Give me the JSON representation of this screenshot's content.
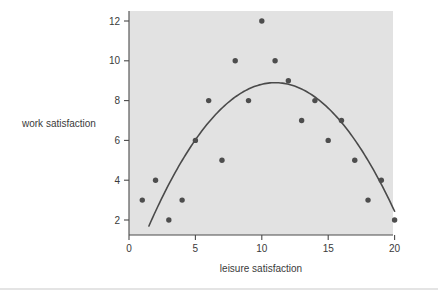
{
  "chart_data": {
    "type": "scatter",
    "title": "",
    "xlabel": "leisure satisfaction",
    "ylabel": "work satisfaction",
    "xlim": [
      0,
      20.8
    ],
    "ylim": [
      1.2,
      12.6
    ],
    "xticks": [
      0,
      5,
      10,
      15,
      20
    ],
    "xtick_labels": [
      "0",
      "5",
      "10",
      "15",
      "20"
    ],
    "yticks": [
      2,
      4,
      6,
      8,
      10,
      12
    ],
    "ytick_labels": [
      "2",
      "4",
      "6",
      "8",
      "10",
      "12"
    ],
    "grid": false,
    "legend": null,
    "point_color": "#4d4d4d",
    "curve_color": "#4a4a4a",
    "plot_background": "#e2e2e2",
    "figure_background": "#ffffff",
    "x": [
      1,
      2,
      3,
      4,
      5,
      6,
      7,
      8,
      9,
      10,
      11,
      12,
      13,
      14,
      15,
      16,
      17,
      18,
      19,
      20
    ],
    "y": [
      3,
      4,
      2,
      3,
      6,
      8,
      5,
      10,
      8,
      12,
      10,
      9,
      7,
      8,
      6,
      7,
      5,
      3,
      4,
      2
    ],
    "points": [
      {
        "x": 1,
        "y": 3
      },
      {
        "x": 2,
        "y": 4
      },
      {
        "x": 3,
        "y": 2
      },
      {
        "x": 4,
        "y": 3
      },
      {
        "x": 5,
        "y": 6
      },
      {
        "x": 6,
        "y": 8
      },
      {
        "x": 7,
        "y": 5
      },
      {
        "x": 8,
        "y": 10
      },
      {
        "x": 9,
        "y": 8
      },
      {
        "x": 10,
        "y": 12
      },
      {
        "x": 11,
        "y": 10
      },
      {
        "x": 12,
        "y": 9
      },
      {
        "x": 13,
        "y": 7
      },
      {
        "x": 14,
        "y": 8
      },
      {
        "x": 15,
        "y": 6
      },
      {
        "x": 16,
        "y": 7
      },
      {
        "x": 17,
        "y": 5
      },
      {
        "x": 18,
        "y": 3
      },
      {
        "x": 19,
        "y": 4
      },
      {
        "x": 20,
        "y": 2
      }
    ],
    "series": [
      {
        "name": "observations",
        "type": "scatter",
        "values": [
          3,
          4,
          2,
          3,
          6,
          8,
          5,
          10,
          8,
          12,
          10,
          9,
          7,
          8,
          6,
          7,
          5,
          3,
          4,
          2
        ]
      },
      {
        "name": "quadratic fit",
        "type": "line",
        "equation": "y = -0.0737x^2 + 1.62x - 0.0",
        "vertex": {
          "x": 11.0,
          "y": 8.9
        },
        "x_range": [
          1.5,
          20.0
        ]
      }
    ],
    "annotations": []
  }
}
